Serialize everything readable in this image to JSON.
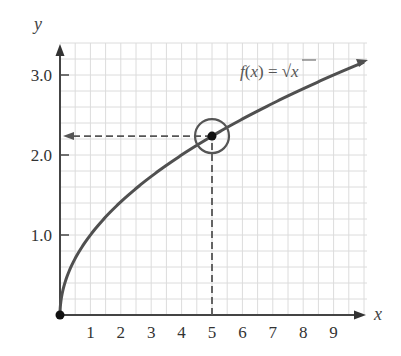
{
  "chart_data": {
    "type": "line",
    "title": "",
    "function_label": "f(x) = √x",
    "function_label_parts": {
      "f": "f",
      "open": "(",
      "x": "x",
      "close": ")",
      "eq": " = ",
      "sqrt": "√",
      "arg": "x"
    },
    "xlabel": "x",
    "ylabel": "y",
    "xlim": [
      0,
      10.3
    ],
    "ylim": [
      0,
      3.4
    ],
    "x_ticks": [
      1,
      2,
      3,
      4,
      5,
      6,
      7,
      8,
      9
    ],
    "x_tick_labels": [
      "1",
      "2",
      "3",
      "4",
      "5",
      "6",
      "7",
      "8",
      "9"
    ],
    "y_ticks": [
      1.0,
      2.0,
      3.0
    ],
    "y_tick_labels": [
      "1.0",
      "2.0",
      "3.0"
    ],
    "grid": true,
    "grid_x_step": 0.5,
    "grid_y_step": 0.2,
    "series": [
      {
        "name": "f(x) = √x",
        "x": [
          0,
          0.25,
          1,
          2,
          3,
          4,
          5,
          6,
          7,
          8,
          9,
          10
        ],
        "values": [
          0,
          0.5,
          1.0,
          1.414,
          1.732,
          2.0,
          2.236,
          2.449,
          2.646,
          2.828,
          3.0,
          3.162
        ]
      }
    ],
    "annotations": [
      {
        "type": "point",
        "x": 0,
        "y": 0,
        "label": "origin"
      },
      {
        "type": "point",
        "x": 5,
        "y": 2.236,
        "circled": true
      },
      {
        "type": "dashed-line",
        "from": [
          5,
          0
        ],
        "to": [
          5,
          2.236
        ]
      },
      {
        "type": "dashed-arrow",
        "from": [
          5,
          2.236
        ],
        "to": [
          0,
          2.236
        ]
      }
    ]
  }
}
